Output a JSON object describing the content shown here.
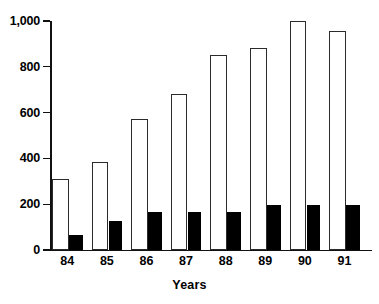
{
  "chart_data": {
    "type": "bar",
    "title": "",
    "subtitle": "",
    "xlabel": "Years",
    "ylabel": "",
    "categories": [
      "84",
      "85",
      "86",
      "87",
      "88",
      "89",
      "90",
      "91"
    ],
    "series": [
      {
        "name": "open",
        "style": "white-bar-black-outline",
        "values": [
          310,
          385,
          570,
          680,
          850,
          880,
          998,
          955
        ]
      },
      {
        "name": "filled",
        "style": "solid-black-bar",
        "values": [
          65,
          125,
          168,
          168,
          168,
          196,
          196,
          195
        ]
      }
    ],
    "ylim": [
      0,
      1000
    ],
    "yticks": [
      0,
      200,
      400,
      600,
      800,
      1000
    ],
    "ytick_labels": [
      "0",
      "200",
      "400",
      "600",
      "800",
      "1,000"
    ],
    "grid": false,
    "legend": "none",
    "colors": {
      "open_fill": "#ffffff",
      "open_stroke": "#2b2b2b",
      "filled": "#000000",
      "axis": "#111111",
      "background": "#ffffff",
      "text": "#000000"
    }
  },
  "axis": {
    "x_title": "Years"
  }
}
